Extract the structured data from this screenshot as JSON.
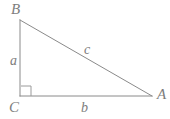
{
  "figure": {
    "kind": "right-triangle-diagram",
    "background_color": "#ffffff",
    "stroke_color": "#8a8a8a",
    "label_color": "#7d7d7d",
    "stroke_width": 1
  },
  "vertices": {
    "b": {
      "label": "B",
      "x": 20,
      "y": 20
    },
    "c": {
      "label": "C",
      "x": 20,
      "y": 96
    },
    "a": {
      "label": "A",
      "x": 152,
      "y": 96
    }
  },
  "sides": {
    "a": {
      "label": "a",
      "from": "C",
      "to": "B"
    },
    "b": {
      "label": "b",
      "from": "C",
      "to": "A"
    },
    "c": {
      "label": "c",
      "from": "A",
      "to": "B"
    }
  },
  "right_angle": {
    "at_vertex": "C",
    "marker": "square",
    "size": 10
  }
}
